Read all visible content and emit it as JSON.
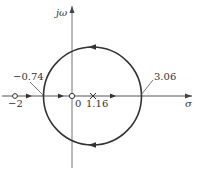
{
  "diagram": {
    "type": "root-locus",
    "axes": {
      "real_label": "σ",
      "imag_label": "jω"
    },
    "origin_label": "0",
    "zeros": [
      {
        "value": -2,
        "label": "−2"
      },
      {
        "value": 0,
        "label": ""
      }
    ],
    "poles": [
      {
        "value": 1.16,
        "label": "1.16"
      }
    ],
    "breakaway_points": [
      {
        "value": -0.74,
        "label": "−0.74"
      },
      {
        "value": 3.06,
        "label": "3.06"
      }
    ],
    "locus": {
      "shape": "circle",
      "real_axis_intercepts": [
        -0.74,
        3.06
      ],
      "direction_upper": "counter-clockwise (leftward at top)",
      "direction_lower": "leftward at bottom"
    },
    "colors": {
      "stroke": "#333333",
      "axis": "#555555",
      "background": "#ffffff"
    }
  }
}
